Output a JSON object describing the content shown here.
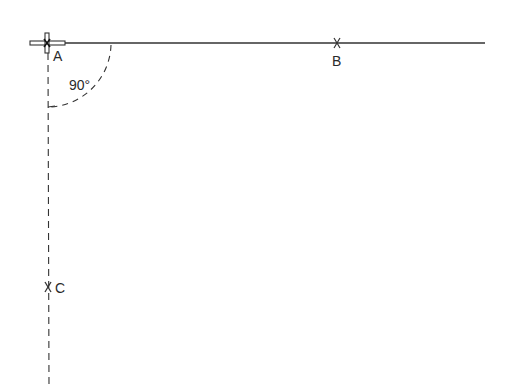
{
  "diagram": {
    "type": "geometric-construction",
    "points": [
      {
        "id": "A",
        "label": "A",
        "x": 47,
        "y": 43
      },
      {
        "id": "B",
        "label": "B",
        "x": 337,
        "y": 43
      },
      {
        "id": "C",
        "label": "C",
        "x": 48,
        "y": 287
      }
    ],
    "angle": {
      "label": "90°",
      "vertex": "A",
      "value": 90
    },
    "colors": {
      "line": "#333333",
      "background": "#ffffff"
    }
  }
}
